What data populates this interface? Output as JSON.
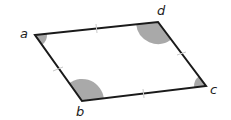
{
  "diagram": {
    "type": "rhombus",
    "colors": {
      "edge": "#1a1a1a",
      "angle_fill": "#a9a9a9",
      "tick": "#c8c8c8",
      "label": "#222222"
    },
    "vertices": [
      {
        "id": "a",
        "label": "a",
        "x": 35,
        "y": 35
      },
      {
        "id": "b",
        "label": "b",
        "x": 82,
        "y": 101
      },
      {
        "id": "c",
        "label": "c",
        "x": 206,
        "y": 86
      },
      {
        "id": "d",
        "label": "d",
        "x": 158,
        "y": 22
      }
    ],
    "edges": [
      {
        "from": "a",
        "to": "d",
        "tick_marks": 1
      },
      {
        "from": "d",
        "to": "c",
        "tick_marks": 1
      },
      {
        "from": "c",
        "to": "b",
        "tick_marks": 1
      },
      {
        "from": "b",
        "to": "a",
        "tick_marks": 1
      }
    ],
    "angle_marks": [
      {
        "vertex": "a",
        "type": "acute",
        "shaded": true
      },
      {
        "vertex": "b",
        "type": "obtuse",
        "shaded": true
      },
      {
        "vertex": "c",
        "type": "acute",
        "shaded": true
      },
      {
        "vertex": "d",
        "type": "obtuse",
        "shaded": true
      }
    ]
  }
}
